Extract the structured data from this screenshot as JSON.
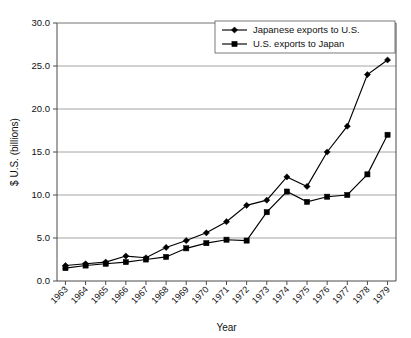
{
  "chart_data": {
    "type": "line",
    "title": "",
    "xlabel": "Year",
    "ylabel": "$ U.S. (billions)",
    "x": [
      1963,
      1964,
      1965,
      1966,
      1967,
      1968,
      1969,
      1970,
      1971,
      1972,
      1973,
      1974,
      1975,
      1976,
      1977,
      1978,
      1979
    ],
    "categories": [
      "1963",
      "1964",
      "1965",
      "1966",
      "1967",
      "1968",
      "1969",
      "1970",
      "1971",
      "1972",
      "1973",
      "1974",
      "1975",
      "1976",
      "1977",
      "1978",
      "1979"
    ],
    "series": [
      {
        "name": "Japanese exports to U.S.",
        "marker": "diamond",
        "color": "#000000",
        "values": [
          1.8,
          2.0,
          2.2,
          2.9,
          2.7,
          3.9,
          4.7,
          5.6,
          6.9,
          8.8,
          9.4,
          12.1,
          11.0,
          15.0,
          18.0,
          24.0,
          25.7
        ]
      },
      {
        "name": "U.S. exports to Japan",
        "marker": "square",
        "color": "#000000",
        "values": [
          1.5,
          1.8,
          2.0,
          2.2,
          2.5,
          2.8,
          3.8,
          4.4,
          4.8,
          4.7,
          8.0,
          10.4,
          9.2,
          9.8,
          10.0,
          12.4,
          17.0
        ]
      }
    ],
    "ylim": [
      0,
      30
    ],
    "ytick_step": 5,
    "ytick_labels": [
      "0.0",
      "5.0",
      "10.0",
      "15.0",
      "20.0",
      "25.0",
      "30.0"
    ],
    "ytick_values": [
      0,
      5,
      10,
      15,
      20,
      25,
      30
    ],
    "grid": true,
    "legend_position": "top-right"
  }
}
